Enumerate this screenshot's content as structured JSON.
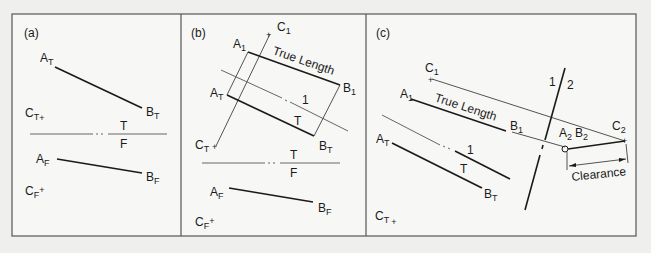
{
  "figure": {
    "panels": [
      {
        "id": "a",
        "label": "(a)",
        "points": {
          "AT": {
            "main": "A",
            "sub": "T"
          },
          "BT": {
            "main": "B",
            "sub": "T"
          },
          "CT": {
            "main": "C",
            "sub": "T"
          },
          "AF": {
            "main": "A",
            "sub": "F"
          },
          "BF": {
            "main": "B",
            "sub": "F"
          },
          "CF": {
            "main": "C",
            "sub": "F"
          }
        },
        "fold_line": {
          "top": "T",
          "bottom": "F"
        }
      },
      {
        "id": "b",
        "label": "(b)",
        "points": {
          "C1": {
            "main": "C",
            "sub": "1"
          },
          "A1": {
            "main": "A",
            "sub": "1"
          },
          "B1": {
            "main": "B",
            "sub": "1"
          },
          "AT": {
            "main": "A",
            "sub": "T"
          },
          "BT": {
            "main": "B",
            "sub": "T"
          },
          "CT": {
            "main": "C",
            "sub": "T"
          },
          "AF": {
            "main": "A",
            "sub": "F"
          },
          "BF": {
            "main": "B",
            "sub": "F"
          },
          "CF": {
            "main": "C",
            "sub": "F"
          }
        },
        "true_length_label": "True Length",
        "aux_fold_line": {
          "top": "1",
          "bottom": "T"
        },
        "fold_line": {
          "top": "T",
          "bottom": "F"
        }
      },
      {
        "id": "c",
        "label": "(c)",
        "points": {
          "C1": {
            "main": "C",
            "sub": "1"
          },
          "A1": {
            "main": "A",
            "sub": "1"
          },
          "B1": {
            "main": "B",
            "sub": "1"
          },
          "AT": {
            "main": "A",
            "sub": "T"
          },
          "BT": {
            "main": "B",
            "sub": "T"
          },
          "CT": {
            "main": "C",
            "sub": "T"
          },
          "A2B2": {
            "a_main": "A",
            "a_sub": "2",
            "b_main": "B",
            "b_sub": "2"
          },
          "C2": {
            "main": "C",
            "sub": "2"
          }
        },
        "true_length_label": "True Length",
        "aux_fold_line": {
          "top": "1",
          "bottom": "T"
        },
        "fold_line_12": {
          "left": "1",
          "right": "2"
        },
        "clearance_label": "Clearance"
      }
    ]
  }
}
